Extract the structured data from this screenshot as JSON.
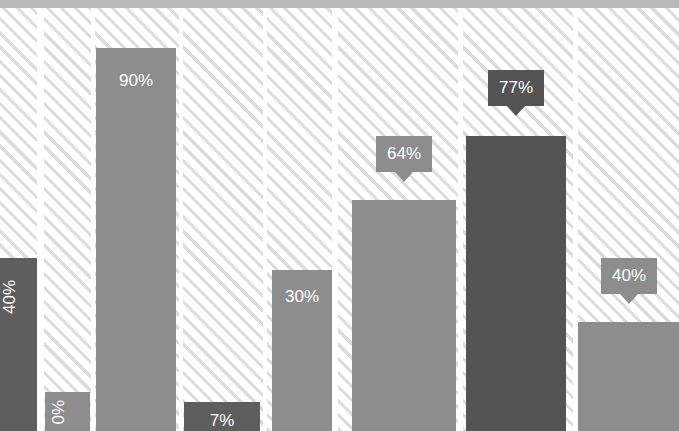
{
  "chart_data": {
    "type": "bar",
    "title": "",
    "subtitle": "",
    "xlabel": "",
    "ylabel": "",
    "ylim": [
      0,
      100
    ],
    "grid": false,
    "legend": null,
    "categories": [
      "1",
      "2",
      "3",
      "4",
      "5",
      "6",
      "7",
      "8"
    ],
    "values": [
      40,
      0,
      90,
      7,
      30,
      64,
      77,
      40
    ],
    "labels": [
      "40%",
      "0%",
      "90%",
      "7%",
      "30%",
      "64%",
      "77%",
      "40%"
    ],
    "series": [
      {
        "name": "Percentage",
        "values": [
          40,
          0,
          90,
          7,
          30,
          64,
          77,
          40
        ]
      }
    ],
    "bars": [
      {
        "index": 0,
        "value": 40,
        "label": "40%",
        "label_style": "inside-rotated",
        "color": "#5e5e5e",
        "col_left": 0,
        "col_width": 37,
        "bar_left": 0,
        "bar_width": 37,
        "bar_top": 250,
        "label_top": 22
      },
      {
        "index": 1,
        "value": 0,
        "label": "0%",
        "label_style": "inside-rotated",
        "color": "#8d8d8d",
        "col_left": 44,
        "col_width": 47,
        "bar_left": 45,
        "bar_width": 45,
        "bar_top": 384,
        "label_top": 8
      },
      {
        "index": 2,
        "value": 90,
        "label": "90%",
        "label_style": "inside",
        "color": "#8d8d8d",
        "col_left": 95,
        "col_width": 84,
        "bar_left": 96,
        "bar_width": 80,
        "bar_top": 40,
        "label_top": 24
      },
      {
        "index": 3,
        "value": 7,
        "label": "7%",
        "label_style": "inside",
        "color": "#5e5e5e",
        "col_left": 183,
        "col_width": 80,
        "bar_left": 184,
        "bar_width": 76,
        "bar_top": 394,
        "label_top": 10
      },
      {
        "index": 4,
        "value": 30,
        "label": "30%",
        "label_style": "inside",
        "color": "#8d8d8d",
        "col_left": 267,
        "col_width": 65,
        "bar_left": 272,
        "bar_width": 60,
        "bar_top": 262,
        "label_top": 18
      },
      {
        "index": 5,
        "value": 64,
        "label": "64%",
        "label_style": "callout",
        "color": "#8d8d8d",
        "callout_color": "#8d8d8d",
        "col_left": 338,
        "col_width": 120,
        "bar_left": 352,
        "bar_width": 104,
        "bar_top": 192,
        "callout_left": 376,
        "callout_top": 128,
        "callout_width": 56
      },
      {
        "index": 6,
        "value": 77,
        "label": "77%",
        "label_style": "callout",
        "color": "#545454",
        "callout_color": "#545454",
        "col_left": 463,
        "col_width": 110,
        "bar_left": 466,
        "bar_width": 100,
        "bar_top": 128,
        "callout_left": 488,
        "callout_top": 62,
        "callout_width": 56
      },
      {
        "index": 7,
        "value": 40,
        "label": "40%",
        "label_style": "callout",
        "color": "#8d8d8d",
        "callout_color": "#8d8d8d",
        "col_left": 578,
        "col_width": 101,
        "bar_left": 578,
        "bar_width": 101,
        "bar_top": 314,
        "callout_left": 601,
        "callout_top": 250,
        "callout_width": 56
      }
    ]
  },
  "style": {
    "bar_color_dark": "#545454",
    "bar_color_mid": "#5e5e5e",
    "bar_color_light": "#8d8d8d",
    "hatch_color": "#dcdcdc",
    "background": "#ffffff",
    "top_band_color": "#b9b9b9",
    "label_text_color": "#ffffff"
  }
}
